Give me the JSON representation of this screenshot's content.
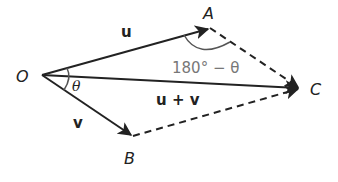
{
  "diagram": {
    "points": {
      "O": {
        "label": "O",
        "x": 42,
        "y": 75
      },
      "A": {
        "label": "A",
        "x": 210,
        "y": 28
      },
      "C": {
        "label": "C",
        "x": 300,
        "y": 88
      },
      "B": {
        "label": "B",
        "x": 133,
        "y": 136
      }
    },
    "vectors": {
      "u": {
        "label": "u",
        "from": "O",
        "to": "A",
        "style": "solid"
      },
      "v": {
        "label": "v",
        "from": "O",
        "to": "B",
        "style": "solid"
      },
      "sum": {
        "label": "u + v",
        "from": "O",
        "to": "C",
        "style": "solid"
      },
      "AC": {
        "from": "A",
        "to": "C",
        "style": "dashed"
      },
      "BC": {
        "from": "B",
        "to": "C",
        "style": "dashed"
      }
    },
    "angles": {
      "theta": {
        "label": "θ",
        "at": "O"
      },
      "supplement": {
        "label": "180° − θ",
        "at": "A"
      }
    },
    "colors": {
      "line": "#222222",
      "angle_label": "#777777",
      "angle_arc": "#555555"
    }
  }
}
